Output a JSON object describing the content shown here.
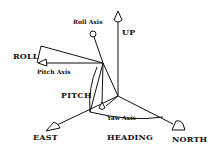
{
  "diagram": {
    "labels": {
      "up": "UP",
      "roll_axis": "Roll Axis",
      "roll": "ROLL",
      "pitch_axis": "Pitch Axis",
      "pitch": "PITCH",
      "yaw_axis": "Yaw Axis",
      "heading": "HEADING",
      "east": "EAST",
      "north": "NORTH"
    },
    "colors": {
      "stroke": "#111111",
      "background": "#ffffff"
    }
  }
}
